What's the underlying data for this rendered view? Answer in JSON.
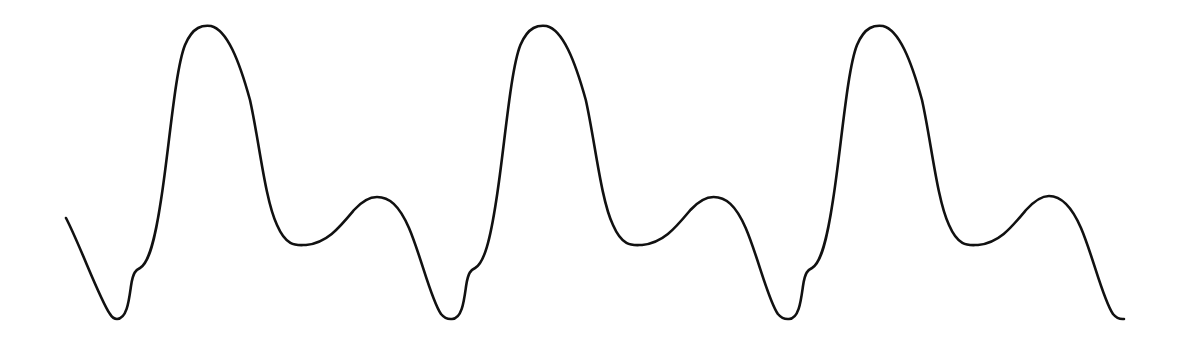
{
  "chart_data": {
    "type": "line",
    "title": "",
    "xlabel": "",
    "ylabel": "",
    "grid": false,
    "legend": null,
    "axes_visible": false,
    "cycles": 3,
    "period_px": 337,
    "stroke_color": "#111111",
    "background_color": "#ffffff",
    "key_points_px": [
      {
        "label": "start",
        "x": 66,
        "y": 218
      },
      {
        "label": "min-1",
        "x": 117,
        "y": 319
      },
      {
        "label": "notch-1",
        "x": 140,
        "y": 269
      },
      {
        "label": "main-peak-1",
        "x": 211,
        "y": 26
      },
      {
        "label": "trough-1",
        "x": 305,
        "y": 245
      },
      {
        "label": "secondary-peak-1",
        "x": 376,
        "y": 197
      },
      {
        "label": "min-2",
        "x": 452,
        "y": 319
      },
      {
        "label": "notch-2",
        "x": 476,
        "y": 269
      },
      {
        "label": "main-peak-2",
        "x": 546,
        "y": 26
      },
      {
        "label": "trough-2",
        "x": 644,
        "y": 245
      },
      {
        "label": "secondary-peak-2",
        "x": 715,
        "y": 197
      },
      {
        "label": "min-3",
        "x": 789,
        "y": 319
      },
      {
        "label": "notch-3",
        "x": 812,
        "y": 269
      },
      {
        "label": "main-peak-3",
        "x": 885,
        "y": 26
      },
      {
        "label": "trough-3",
        "x": 982,
        "y": 245
      },
      {
        "label": "secondary-peak-3",
        "x": 1052,
        "y": 196
      },
      {
        "label": "end",
        "x": 1124,
        "y": 317
      }
    ],
    "relative_levels": {
      "baseline_min": 0,
      "notch": 0.17,
      "main_peak": 1.0,
      "trough": 0.25,
      "secondary_peak": 0.41
    }
  }
}
